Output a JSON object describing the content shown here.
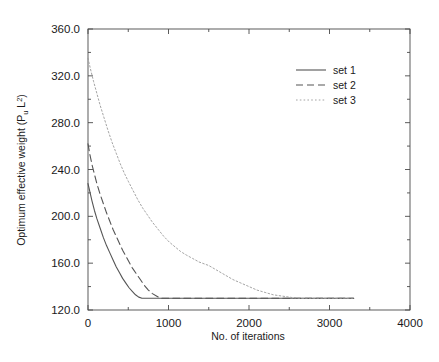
{
  "chart_data": {
    "type": "line",
    "title": "",
    "xlabel": "No. of iterations",
    "ylabel": "Optimum effective weight (P_u L^2)",
    "ylabel_parts": {
      "main_a": "Optimum effective weight (P",
      "sub": "u",
      "main_b": "L",
      "sup": "2",
      "main_c": ")"
    },
    "xlim": [
      0,
      4000
    ],
    "ylim": [
      120.0,
      360.0
    ],
    "xticks": [
      0,
      1000,
      2000,
      3000,
      4000
    ],
    "xtick_labels": [
      "0",
      "1000",
      "2000",
      "3000",
      "4000"
    ],
    "yticks": [
      120.0,
      160.0,
      200.0,
      240.0,
      280.0,
      320.0,
      360.0
    ],
    "ytick_labels": [
      "120.0",
      "160.0",
      "200.0",
      "240.0",
      "280.0",
      "320.0",
      "360.0"
    ],
    "x_minor_interval": 500,
    "y_minor_interval": 20,
    "grid": false,
    "legend_position": "top-right",
    "converged_value": 130,
    "series": [
      {
        "name": "set 1",
        "style": "solid",
        "color": "#555555",
        "points": [
          [
            0,
            228
          ],
          [
            20,
            222
          ],
          [
            50,
            213
          ],
          [
            80,
            205
          ],
          [
            110,
            198
          ],
          [
            150,
            190
          ],
          [
            190,
            182
          ],
          [
            230,
            175
          ],
          [
            270,
            169
          ],
          [
            310,
            163
          ],
          [
            350,
            157
          ],
          [
            390,
            152
          ],
          [
            430,
            147
          ],
          [
            470,
            143
          ],
          [
            510,
            139
          ],
          [
            550,
            136
          ],
          [
            590,
            133
          ],
          [
            630,
            131
          ],
          [
            670,
            130
          ],
          [
            720,
            130
          ],
          [
            900,
            130
          ],
          [
            1200,
            130
          ],
          [
            1600,
            130
          ],
          [
            2000,
            130
          ],
          [
            2500,
            130
          ],
          [
            3000,
            130
          ],
          [
            3300,
            130
          ]
        ]
      },
      {
        "name": "set 2",
        "style": "dashed",
        "color": "#555555",
        "points": [
          [
            0,
            262
          ],
          [
            20,
            254
          ],
          [
            50,
            244
          ],
          [
            80,
            236
          ],
          [
            110,
            228
          ],
          [
            150,
            219
          ],
          [
            190,
            211
          ],
          [
            230,
            203
          ],
          [
            270,
            196
          ],
          [
            310,
            189
          ],
          [
            350,
            183
          ],
          [
            390,
            177
          ],
          [
            430,
            171
          ],
          [
            470,
            166
          ],
          [
            510,
            161
          ],
          [
            550,
            156
          ],
          [
            600,
            151
          ],
          [
            650,
            146
          ],
          [
            700,
            141
          ],
          [
            750,
            137
          ],
          [
            800,
            134
          ],
          [
            850,
            132
          ],
          [
            900,
            130
          ],
          [
            1000,
            130
          ],
          [
            1400,
            130
          ],
          [
            1800,
            130
          ],
          [
            2300,
            130
          ],
          [
            2800,
            130
          ],
          [
            3300,
            130
          ]
        ]
      },
      {
        "name": "set 3",
        "style": "dotted",
        "color": "#9a9a9a",
        "points": [
          [
            0,
            335
          ],
          [
            30,
            326
          ],
          [
            70,
            315
          ],
          [
            110,
            305
          ],
          [
            150,
            295
          ],
          [
            200,
            284
          ],
          [
            250,
            273
          ],
          [
            300,
            263
          ],
          [
            350,
            254
          ],
          [
            400,
            245
          ],
          [
            450,
            237
          ],
          [
            500,
            230
          ],
          [
            560,
            222
          ],
          [
            620,
            214
          ],
          [
            680,
            207
          ],
          [
            740,
            201
          ],
          [
            800,
            195
          ],
          [
            870,
            189
          ],
          [
            940,
            183
          ],
          [
            1010,
            178
          ],
          [
            1080,
            174
          ],
          [
            1150,
            170
          ],
          [
            1220,
            167
          ],
          [
            1300,
            164
          ],
          [
            1380,
            161
          ],
          [
            1460,
            159
          ],
          [
            1500,
            158
          ],
          [
            1600,
            154
          ],
          [
            1700,
            150
          ],
          [
            1800,
            146
          ],
          [
            1900,
            143
          ],
          [
            2000,
            140
          ],
          [
            2100,
            137
          ],
          [
            2200,
            135
          ],
          [
            2300,
            133
          ],
          [
            2400,
            132
          ],
          [
            2500,
            131
          ],
          [
            2600,
            130
          ],
          [
            2800,
            130
          ],
          [
            3000,
            130
          ],
          [
            3300,
            130
          ]
        ]
      }
    ]
  },
  "legend": {
    "items": [
      {
        "label": "set 1",
        "style": "solid"
      },
      {
        "label": "set 2",
        "style": "dashed"
      },
      {
        "label": "set 3",
        "style": "dotted"
      }
    ]
  }
}
